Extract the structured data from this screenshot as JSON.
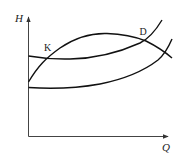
{
  "diagram": {
    "type": "pump-system characteristic curves (H–Q)",
    "axes": {
      "y_label": "H",
      "x_label": "Q"
    },
    "points": [
      {
        "id": "K",
        "label": "K"
      },
      {
        "id": "D",
        "label": "D"
      }
    ],
    "curves": [
      {
        "id": "arch-curve",
        "description": "rising then falling (pump H–Q curve), passes K and D"
      },
      {
        "id": "flat-rising-curve",
        "description": "nearly flat then rising steeply, passes K and D"
      },
      {
        "id": "lower-rising-curve",
        "description": "low start, rises, crosses arch curve near right edge"
      }
    ],
    "colors": {
      "curve": "#111111",
      "axis": "#444444",
      "background": "#ffffff"
    }
  }
}
